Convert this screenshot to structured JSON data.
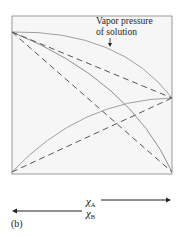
{
  "diagram": {
    "annotation": {
      "line1": "Vapor pressure",
      "line2": "of solution"
    },
    "axis": {
      "mole_fraction_A": {
        "symbol": "χ",
        "subscript": "A",
        "direction": "right"
      },
      "mole_fraction_B": {
        "symbol": "χ",
        "subscript": "B",
        "direction": "left"
      }
    },
    "panel_label": "(b)",
    "colors": {
      "frame": "#9a9a9a",
      "solid_curves": "#9a9a9a",
      "dashed_lines": "#555555",
      "background": "#f5f5f5"
    }
  }
}
